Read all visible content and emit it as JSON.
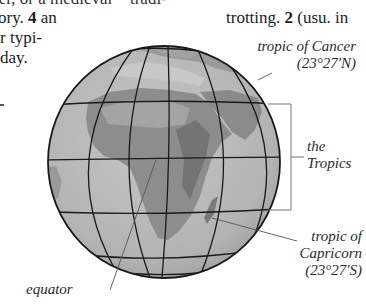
{
  "page": {
    "column_left": {
      "line0": "ter, or a medieval ~ tradi-",
      "line1_pre": "ory.",
      "line1_num": "4",
      "line1_post": "an",
      "line2": "r typi-",
      "line3": "day."
    },
    "column_right": {
      "line0": "",
      "line1_pre": "trotting.",
      "line1_num": "2",
      "line1_post": "(usu. in"
    }
  },
  "illustration": {
    "subject": "globe showing Africa with tropics",
    "labels": {
      "cancer_line1": "tropic of Cancer",
      "cancer_line2": "(23°27′N)",
      "tropics_line1": "the",
      "tropics_line2": "Tropics",
      "capricorn_line1": "tropic of",
      "capricorn_line2": "Capricorn",
      "capricorn_line3": "(23°27′S)",
      "equator": "equator"
    },
    "colors": {
      "ocean": "#b9b9b9",
      "land": "#8d8d8d",
      "land_dark": "#6f6f6f",
      "grid": "#1a1a1a",
      "bracket": "#6a6a6a"
    }
  }
}
